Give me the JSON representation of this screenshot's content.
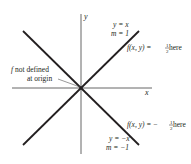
{
  "figure": {
    "axes": {
      "x_label": "x",
      "y_label": "y"
    },
    "lines": [
      {
        "id": "line-y-equals-x",
        "equation": "y = x",
        "slope_label": "m = 1",
        "value_label_prefix": "f(x, y) = ",
        "value_sign": "",
        "value_num": "1",
        "value_den": "2",
        "value_suffix": " here"
      },
      {
        "id": "line-y-equals-neg-x",
        "equation": "y = −x",
        "slope_label": "m = −1",
        "value_label_prefix": "f(x, y) = ",
        "value_sign": "−",
        "value_num": "1",
        "value_den": "2",
        "value_suffix": " here"
      }
    ],
    "annotation": {
      "line1": "f not defined",
      "line1_f": "f",
      "line1_rest": " not defined",
      "line2": "at origin"
    },
    "colors": {
      "ink": "#231f20",
      "axis": "#555555",
      "background": "#ffffff"
    }
  }
}
